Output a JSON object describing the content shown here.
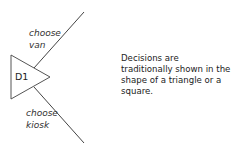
{
  "diagram": {
    "node": {
      "label": "D1",
      "shape": "triangle"
    },
    "branches": [
      {
        "line1": "choose",
        "line2": "van"
      },
      {
        "line1": "choose",
        "line2": "kiosk"
      }
    ],
    "description": "Decisions are traditionally shown in the shape of a triangle or a square.",
    "colors": {
      "line": "#444444",
      "text": "#222222",
      "background": "#ffffff"
    }
  }
}
